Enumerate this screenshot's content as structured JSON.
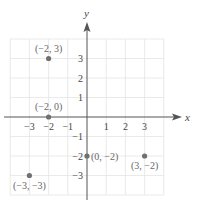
{
  "chart_data": {
    "type": "scatter",
    "title": "",
    "xlabel": "x",
    "ylabel": "y",
    "xlim": [
      -4,
      4
    ],
    "ylim": [
      -4,
      4
    ],
    "grid": true,
    "x_ticks": [
      -3,
      -2,
      -1,
      1,
      2,
      3
    ],
    "y_ticks": [
      3,
      2,
      1,
      -1,
      -2,
      -3
    ],
    "x_tick_labels": [
      "−3",
      "−2",
      "−1",
      "1",
      "2",
      "3"
    ],
    "y_tick_labels": [
      "3",
      "2",
      "1",
      "−1",
      "−2",
      "−3"
    ],
    "points": [
      {
        "x": -2,
        "y": 3,
        "label": "(−2, 3)"
      },
      {
        "x": -2,
        "y": 0,
        "label": "(−2, 0)"
      },
      {
        "x": 0,
        "y": -2,
        "label": "(0, −2)"
      },
      {
        "x": 3,
        "y": -2,
        "label": "(3, −2)"
      },
      {
        "x": -3,
        "y": -3,
        "label": "(−3, −3)"
      }
    ],
    "colors": {
      "axis": "#555555",
      "grid": "#e4e4e4",
      "point": "#707070",
      "text": "#444444"
    }
  }
}
